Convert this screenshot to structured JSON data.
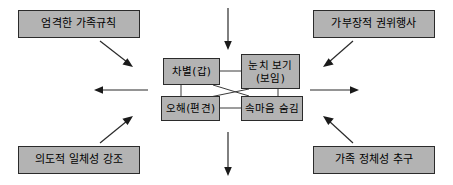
{
  "diagram": {
    "background_color": "#ffffff",
    "box_fill_color": "#b3b3b3",
    "box_border_color": "#2b2b2b",
    "line_color": "#2a2a2a",
    "outer_boxes": [
      {
        "id": "top-left",
        "label": "엄격한 가족규칙"
      },
      {
        "id": "top-right",
        "label": "가부장적 권위행사"
      },
      {
        "id": "bottom-left",
        "label": "의도적 일체성 강조"
      },
      {
        "id": "bottom-right",
        "label": "가족 정체성 추구"
      }
    ],
    "inner_boxes": [
      {
        "id": "center-top-left",
        "label": "차별(갑)"
      },
      {
        "id": "center-top-right",
        "label_line1": "눈치 보기",
        "label_line2": "(보임)"
      },
      {
        "id": "center-bottom-left",
        "label": "오해(편견)"
      },
      {
        "id": "center-bottom-right",
        "label": "속마음 숨김"
      }
    ],
    "arrows": [
      {
        "id": "top-center-down",
        "direction": "down"
      },
      {
        "id": "bottom-center-down",
        "direction": "down"
      },
      {
        "id": "left-horizontal",
        "direction": "left"
      },
      {
        "id": "right-horizontal",
        "direction": "right"
      },
      {
        "id": "top-left-diagonal",
        "direction": "down-right"
      },
      {
        "id": "top-right-diagonal",
        "direction": "down-left"
      },
      {
        "id": "bottom-left-diagonal",
        "direction": "up-right"
      },
      {
        "id": "bottom-right-diagonal",
        "direction": "up-left"
      }
    ],
    "connectors": [
      {
        "id": "top-horizontal-link",
        "from": "center-top-left",
        "to": "center-top-right"
      },
      {
        "id": "bottom-horizontal-link",
        "from": "center-bottom-left",
        "to": "center-bottom-right"
      },
      {
        "id": "left-vertical-link",
        "from": "center-top-left",
        "to": "center-bottom-left"
      },
      {
        "id": "right-vertical-link",
        "from": "center-top-right",
        "to": "center-bottom-right"
      },
      {
        "id": "cross-link-a",
        "from": "center-top-left",
        "to": "center-bottom-right"
      },
      {
        "id": "cross-link-b",
        "from": "center-top-right",
        "to": "center-bottom-left"
      }
    ]
  }
}
